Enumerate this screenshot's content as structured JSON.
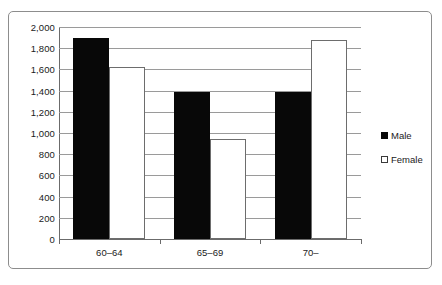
{
  "chart_data": {
    "type": "bar",
    "title": "",
    "subtitle": "",
    "xlabel": "",
    "ylabel": "",
    "categories": [
      "60–64",
      "65–69",
      "70–"
    ],
    "series": [
      {
        "name": "Male",
        "values": [
          1900,
          1390,
          1390
        ],
        "color": "#000000",
        "fill": "solid-black"
      },
      {
        "name": "Female",
        "values": [
          1620,
          940,
          1880
        ],
        "color": "#ffffff",
        "fill": "white-outlined"
      }
    ],
    "ylim": [
      0,
      2000
    ],
    "ytick_step": 200,
    "ytick_labels": [
      "0",
      "200",
      "400",
      "600",
      "800",
      "1,000",
      "1,200",
      "1,400",
      "1,600",
      "1,800",
      "2,000"
    ],
    "ytick_values": [
      0,
      200,
      400,
      600,
      800,
      1000,
      1200,
      1400,
      1600,
      1800,
      2000
    ],
    "grid": "horizontal",
    "legend_position": "right",
    "legend_entries": [
      {
        "label": "Male",
        "swatch": "filled-square"
      },
      {
        "label": "Female",
        "swatch": "outlined-square"
      }
    ],
    "border": true
  },
  "colors": {
    "male_bar": "#080808",
    "female_bar": "#ffffff",
    "female_bar_outline": "#6d6d6d",
    "gridline": "#9a9a9a",
    "axis": "#6b6b6b",
    "frame": "#8d8d8d",
    "text": "#1a1a1a",
    "background": "#ffffff"
  }
}
